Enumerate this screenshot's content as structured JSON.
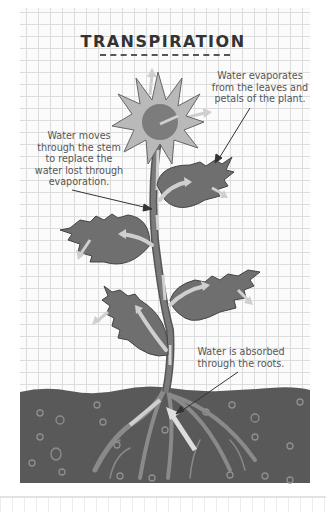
{
  "diagram": {
    "title": "TRANSPIRATION",
    "labels": {
      "evaporation": [
        "Water evaporates",
        "from the leaves and",
        "petals of the plant."
      ],
      "stem": [
        "Water moves",
        "through the stem",
        "to replace the",
        "water lost through",
        "evaporation."
      ],
      "roots": [
        "Water is absorbed",
        "through the roots."
      ]
    },
    "parts": [
      "flower",
      "stem",
      "leaves",
      "roots",
      "soil"
    ],
    "colors": {
      "petal": "#b9b9b9",
      "flower_center": "#7c7c7c",
      "leaf": "#6f6f6f",
      "stem": "#777777",
      "soil": "#595959",
      "water_arrow": "#cfcfcf",
      "grid_line": "#dcdcdc",
      "text": "#555555"
    }
  }
}
